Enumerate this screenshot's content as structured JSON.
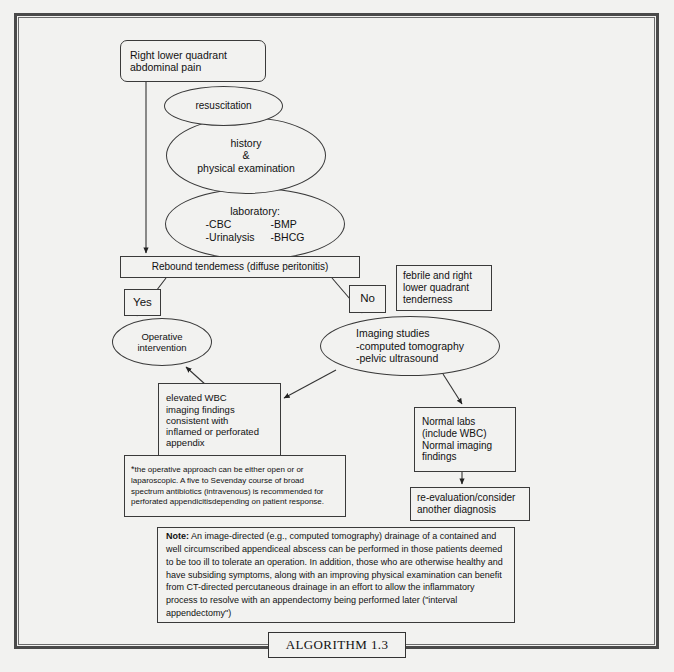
{
  "figure": {
    "caption": "ALGORITHM 1.3"
  },
  "nodes": {
    "chief_complaint": {
      "line1": "Right lower quadrant",
      "line2": "abdominal pain"
    },
    "resuscitation": {
      "line1": "resuscitation"
    },
    "history": {
      "line1": "history",
      "line2": "&",
      "line3": "physical examination"
    },
    "laboratory": {
      "title": "laboratory:",
      "item1": "-CBC",
      "item2": "-BMP",
      "item3": "-Urinalysis",
      "item4": "-BHCG"
    },
    "rebound": {
      "label": "Rebound tendemess (diffuse peritonitis)"
    },
    "yes": {
      "label": "Yes"
    },
    "no": {
      "label": "No"
    },
    "febrile": {
      "line1": "febrile and right",
      "line2": "lower quadrant",
      "line3": "tenderness"
    },
    "operative": {
      "line1": "Operative",
      "line2": "intervention"
    },
    "imaging": {
      "line1": "Imaging studies",
      "line2": "-computed tomography",
      "line3": "-pelvic ultrasound"
    },
    "elevated": {
      "line1": "elevated WBC",
      "line2": "imaging findings",
      "line3": "consistent with",
      "line4": "inflamed or perforated",
      "line5": "appendix"
    },
    "normal": {
      "line1": "Normal labs",
      "line2": "(include WBC)",
      "line3": "Normal imaging",
      "line4": "findings"
    },
    "reevaluation": {
      "line1": "re-evaluation/consider",
      "line2": "another diagnosis"
    },
    "footnote": {
      "marker": "*",
      "text": "the operative approach can be either open or or laparoscopic.  A five to Sevenday course of broad spectrum antibiotics (intravenous) is recommended for perforated appendicitisdepending on patient response."
    },
    "note": {
      "label": "Note:",
      "text": " An image-directed (e.g., computed tomography) drainage of a contained and well circumscribed appendiceal abscess can be performed in those patients deemed to be too ill to tolerate an operation. In addition, those who are otherwise healthy and have subsiding symptoms, along with an improving physical examination can benefit from CT-directed percutaneous drainage in an effort to allow the inflammatory process to resolve with an appendectomy being performed later (\"interval appendectomy\")"
    }
  },
  "colors": {
    "page_background": "#f2f2f0",
    "frame_outer": "#4a4a4a",
    "frame_inner": "#6b6b6b",
    "stroke": "#3a3a3a",
    "text": "#111111"
  }
}
